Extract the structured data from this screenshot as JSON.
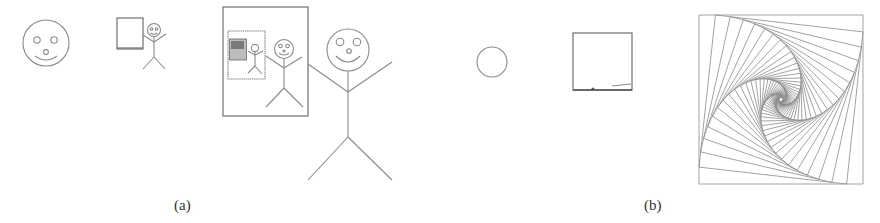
{
  "figure": {
    "panels": [
      {
        "id": "a",
        "label": "(a)",
        "description": "Recursive drawing: smiley face, picture of stick figure holding picture, larger stick figure beside framed nested picture",
        "elements": [
          "smiley-face",
          "small-picture-with-stick-figure",
          "framed-nested-picture-with-large-stick-figure"
        ]
      },
      {
        "id": "b",
        "label": "(b)",
        "description": "Recursive drawing: circle, square, spiral of nested rotated squares",
        "elements": [
          "circle",
          "square",
          "rotated-squares-spiral"
        ]
      }
    ],
    "colors": {
      "stroke": "#8a8a8a",
      "background": "#ffffff"
    },
    "spiral": {
      "outer_square": [
        699,
        15,
        863,
        184
      ],
      "steps": 40,
      "rotation_ratio": 0.1
    }
  }
}
